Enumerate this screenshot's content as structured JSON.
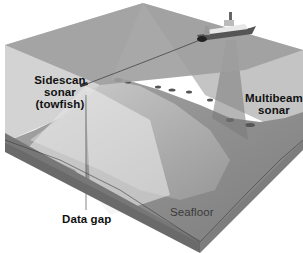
{
  "diagram": {
    "type": "block-diagram",
    "labels": {
      "sidescan": [
        "Sidescan",
        "sonar",
        "(towfish)"
      ],
      "multibeam": [
        "Multibeam",
        "sonar"
      ],
      "data_gap": "Data gap",
      "seafloor": "Seafloor"
    },
    "icons": {
      "ship": "survey-ship-icon",
      "towfish": "towfish-icon"
    },
    "colors": {
      "water_surface": "#9c9c9c",
      "water_side": "#c8c8c8",
      "seafloor": "#8a8a8a",
      "block_side": "#6e6e6e",
      "beam": "#dcdcdc",
      "text": "#111111"
    }
  }
}
